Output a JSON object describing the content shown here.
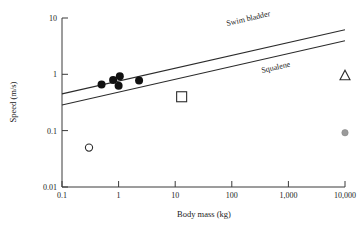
{
  "chart_data": {
    "type": "scatter",
    "title": "",
    "xlabel": "Body mass (kg)",
    "ylabel": "Speed (m/s)",
    "xscale": "log",
    "yscale": "log",
    "xlim": [
      0.1,
      10000
    ],
    "ylim": [
      0.01,
      10
    ],
    "grid": false,
    "legend": "none",
    "xticks": [
      0.1,
      1,
      10,
      100,
      1000,
      10000
    ],
    "xtick_labels": [
      "0.1",
      "1",
      "10",
      "100",
      "1,000",
      "10,000"
    ],
    "yticks": [
      0.01,
      0.1,
      1,
      10
    ],
    "ytick_labels": [
      "0.01",
      "0.1",
      "1",
      "10"
    ],
    "series": [
      {
        "name": "filled-circles",
        "marker": "filled-circle",
        "color": "#111111",
        "points": [
          {
            "x": 0.5,
            "y": 0.66
          },
          {
            "x": 0.8,
            "y": 0.79
          },
          {
            "x": 1.05,
            "y": 0.92
          },
          {
            "x": 1.0,
            "y": 0.63
          },
          {
            "x": 2.3,
            "y": 0.78
          }
        ]
      },
      {
        "name": "open-circle",
        "marker": "open-circle",
        "color": "#2b2b2b",
        "points": [
          {
            "x": 0.3,
            "y": 0.05
          }
        ]
      },
      {
        "name": "open-square",
        "marker": "open-square",
        "color": "#2b2b2b",
        "points": [
          {
            "x": 13.0,
            "y": 0.4
          }
        ]
      },
      {
        "name": "open-triangle",
        "marker": "open-triangle",
        "color": "#2b2b2b",
        "points": [
          {
            "x": 10000,
            "y": 0.95
          }
        ]
      },
      {
        "name": "gray-circle",
        "marker": "gray-filled-circle",
        "color": "#9a9a9a",
        "points": [
          {
            "x": 10000,
            "y": 0.092
          }
        ]
      }
    ],
    "lines": [
      {
        "name": "swim-bladder",
        "label": "Swim bladder",
        "from": {
          "x": 0.1,
          "y": 0.45
        },
        "to": {
          "x": 10000,
          "y": 6.2
        }
      },
      {
        "name": "squalene",
        "label": "Squalene",
        "from": {
          "x": 0.1,
          "y": 0.285
        },
        "to": {
          "x": 10000,
          "y": 3.95
        }
      }
    ],
    "annotations": [
      {
        "name": "swim-bladder-label",
        "text": "Swim bladder"
      },
      {
        "name": "squalene-label",
        "text": "Squalene"
      }
    ]
  },
  "axes": {
    "x_title": "Body mass (kg)",
    "y_title": "Speed (m/s)",
    "x_labels": [
      "0.1",
      "1",
      "10",
      "100",
      "1,000",
      "10,000"
    ],
    "y_labels": [
      "10",
      "1",
      "0.1",
      "0.01"
    ]
  },
  "labels": {
    "swim_bladder": "Swim bladder",
    "squalene": "Squalene"
  }
}
